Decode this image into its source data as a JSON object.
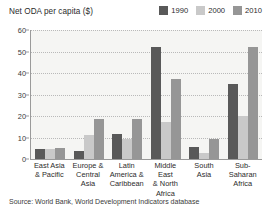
{
  "chart_data": {
    "type": "bar",
    "title": "Net ODA per capita ($)",
    "xlabel": "",
    "ylabel": "",
    "ylim": [
      0,
      60
    ],
    "yticks": [
      0,
      10,
      20,
      30,
      40,
      50,
      60
    ],
    "grid": true,
    "legend_position": "top-right",
    "categories": [
      "East Asia\n& Pacific",
      "Europe &\nCentral\nAsia",
      "Latin\nAmerica &\nCaribbean",
      "Middle East\n& North\nAfrica",
      "South\nAsia",
      "Sub-\nSaharan\nAfrica"
    ],
    "category_lines": [
      [
        "East Asia",
        "& Pacific"
      ],
      [
        "Europe &",
        "Central",
        "Asia"
      ],
      [
        "Latin",
        "America &",
        "Caribbean"
      ],
      [
        "Middle East",
        "& North",
        "Africa"
      ],
      [
        "South",
        "Asia"
      ],
      [
        "Sub-",
        "Saharan",
        "Africa"
      ]
    ],
    "series": [
      {
        "name": "1990",
        "color": "#595959",
        "values": [
          4.8,
          3.5,
          11.5,
          52.0,
          5.4,
          35.0
        ]
      },
      {
        "name": "2000",
        "color": "#c9c9c9",
        "values": [
          4.6,
          11.2,
          9.2,
          17.0,
          2.8,
          19.8
        ]
      },
      {
        "name": "2010",
        "color": "#969696",
        "values": [
          5.0,
          18.4,
          18.7,
          37.0,
          9.4,
          52.0
        ]
      }
    ],
    "source": "Source: World Bank, World Development Indicators database"
  },
  "colors": {
    "plot_background": "#f5f5f3",
    "axis": "#9a9a9a",
    "gridline": "#b9b9b9",
    "text": "#2b2b2b",
    "page_background": "#ffffff"
  }
}
